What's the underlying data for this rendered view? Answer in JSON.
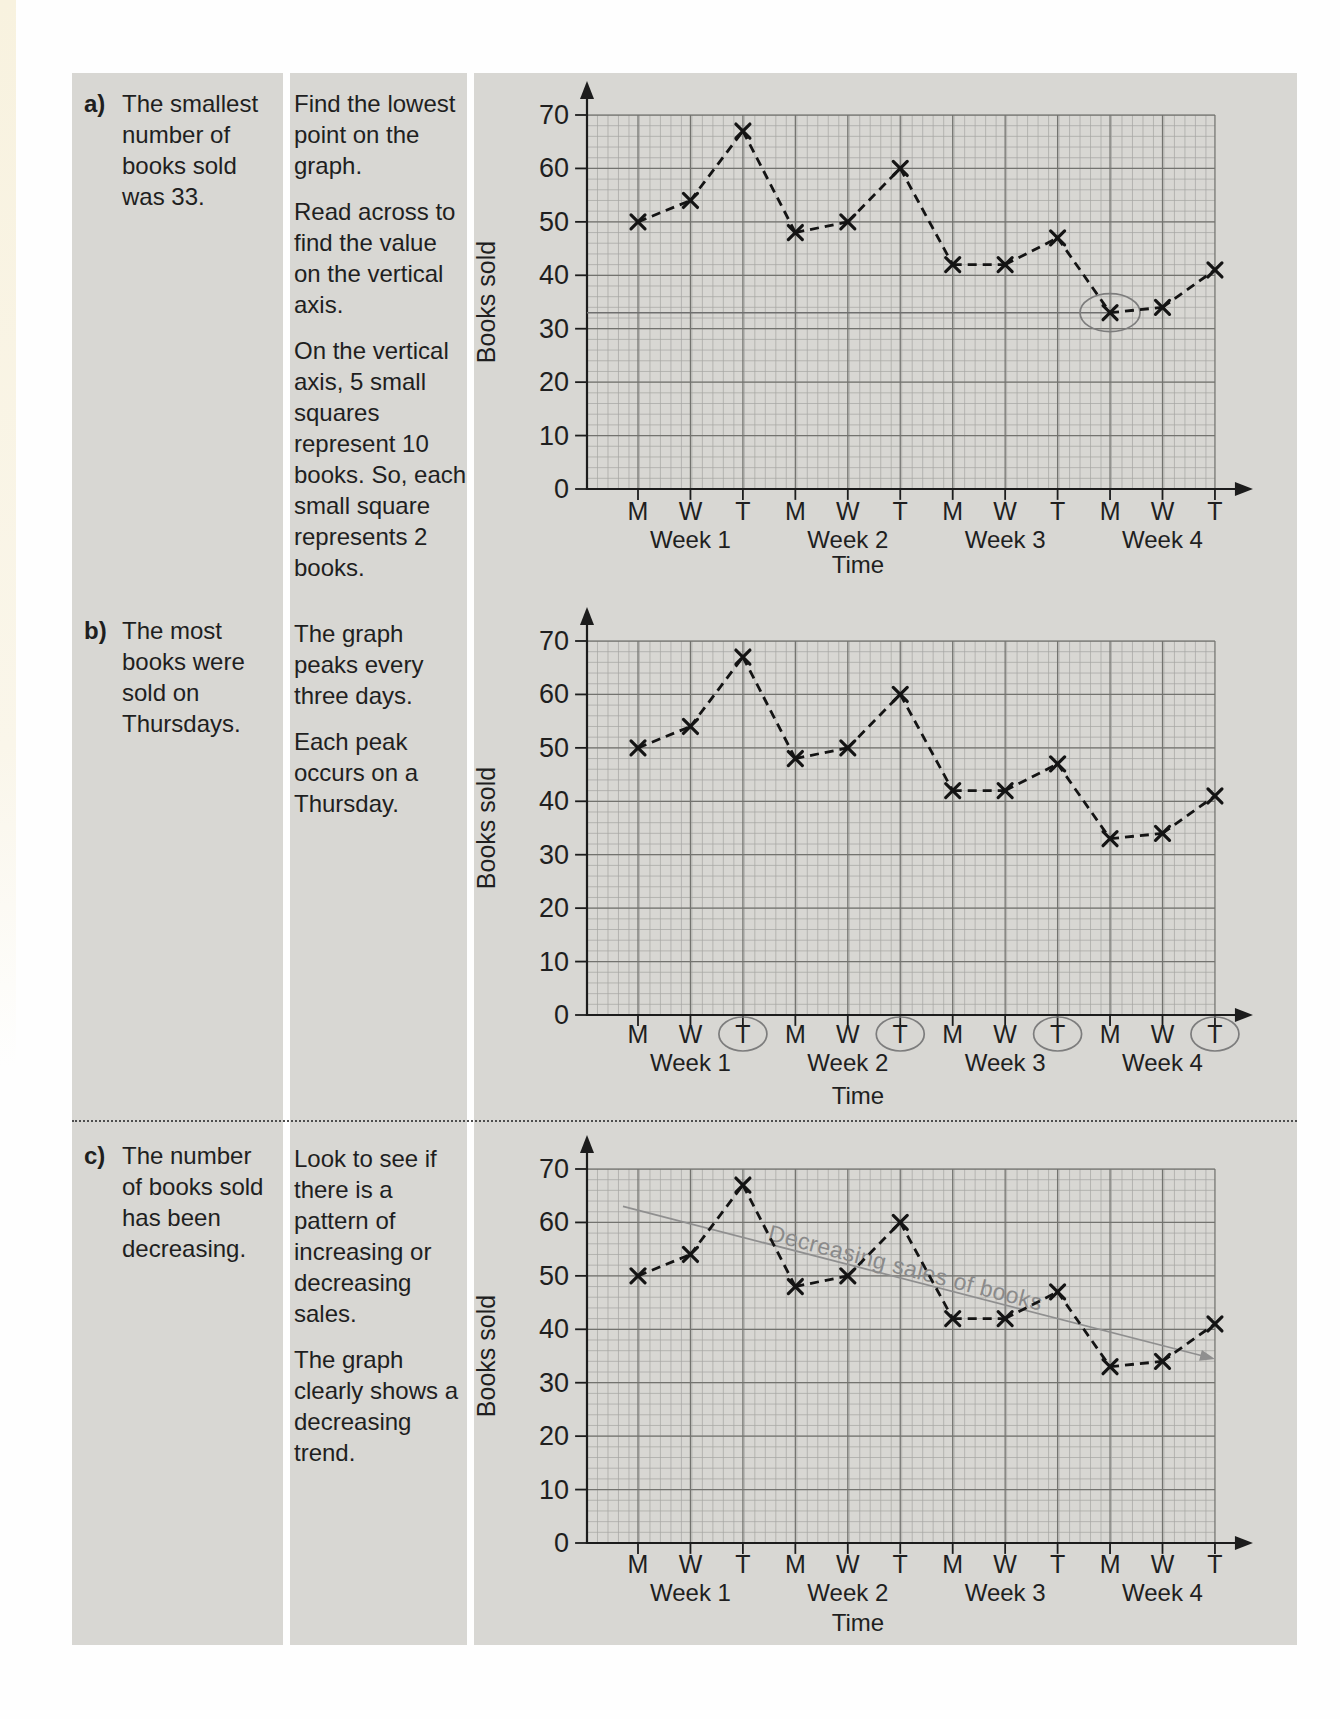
{
  "page": {
    "background": "#fefefe",
    "panel_color": "#d8d7d3",
    "edge_strip_color": "#f8f2df"
  },
  "rows": [
    {
      "label": "a)",
      "answer": "The smallest number of books sold was 33.",
      "explanation": [
        "Find the lowest point on the graph.",
        "Read across to find the value on the vertical axis.",
        "On the vertical axis, 5 small squares represent 10 books. So, each small square represents 2 books."
      ]
    },
    {
      "label": "b)",
      "answer": "The most books were sold on Thursdays.",
      "explanation": [
        "The graph peaks every three days.",
        "Each peak occurs on a Thursday."
      ]
    },
    {
      "label": "c)",
      "answer": "The number of books sold has been decreasing.",
      "explanation": [
        "Look to see if there is a pattern of increasing or decreasing sales.",
        "The graph clearly shows a decreasing trend."
      ]
    }
  ],
  "chart_data": {
    "type": "line",
    "x_labels": [
      "M",
      "W",
      "T",
      "M",
      "W",
      "T",
      "M",
      "W",
      "T",
      "M",
      "W",
      "T"
    ],
    "week_labels": [
      "Week 1",
      "Week 2",
      "Week 3",
      "Week 4"
    ],
    "values": [
      50,
      54,
      67,
      48,
      50,
      60,
      42,
      42,
      47,
      33,
      34,
      41
    ],
    "xlabel": "Time",
    "ylabel": "Books sold",
    "ylim": [
      0,
      70
    ],
    "yticks": [
      0,
      10,
      20,
      30,
      40,
      50,
      60,
      70
    ],
    "grid": {
      "minor_per_major": 5,
      "note": "5 small squares represent 10 books; each small square represents 2 books"
    },
    "series_style": "black dashed line with x markers",
    "colors": {
      "line": "#141414",
      "grid_minor": "#a0a09d",
      "grid_major": "#73736f",
      "axis": "#1c1c1c",
      "annotation_gray": "#7d7d7d",
      "trend": "#8f8f8f",
      "trend_text": "#8a8a8a",
      "read_line": "#6f6f6f"
    },
    "charts": [
      {
        "id": "chart-a",
        "annotations": {
          "read_line_value": 33,
          "circled_point": {
            "week": "Week 4",
            "day": "M",
            "value": 33
          }
        }
      },
      {
        "id": "chart-b",
        "annotations": {
          "circled_day_indices": [
            2,
            5,
            8,
            11
          ],
          "circled_day_label": "T"
        }
      },
      {
        "id": "chart-c",
        "annotations": {
          "trend_label": "Decreasing sales of books",
          "trend_start_value": 63,
          "trend_end_value": 35
        }
      }
    ]
  }
}
